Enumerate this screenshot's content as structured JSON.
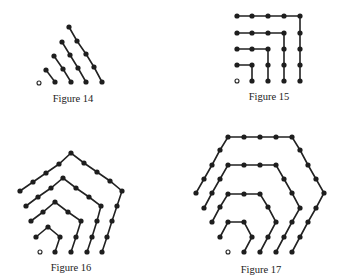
{
  "figures": [
    {
      "caption": "Figure 14",
      "caption_pos": [
        73,
        93
      ],
      "origin": [
        39,
        83
      ],
      "chains": [
        [
          [
            46,
            70
          ],
          [
            55,
            82
          ]
        ],
        [
          [
            54,
            56
          ],
          [
            63,
            69
          ],
          [
            71,
            82
          ]
        ],
        [
          [
            62,
            42
          ],
          [
            70,
            55
          ],
          [
            78,
            68
          ],
          [
            86,
            82
          ]
        ],
        [
          [
            69,
            27
          ],
          [
            77,
            41
          ],
          [
            86,
            54
          ],
          [
            94,
            67
          ],
          [
            102,
            82
          ]
        ]
      ]
    },
    {
      "caption": "Figure 15",
      "caption_pos": [
        269,
        91
      ],
      "origin": [
        237,
        81
      ],
      "chains": [
        [
          [
            237,
            65
          ],
          [
            252,
            65
          ],
          [
            252,
            81
          ]
        ],
        [
          [
            237,
            49
          ],
          [
            252,
            49
          ],
          [
            268,
            49
          ],
          [
            268,
            65
          ],
          [
            268,
            81
          ]
        ],
        [
          [
            237,
            33
          ],
          [
            252,
            33
          ],
          [
            268,
            33
          ],
          [
            284,
            33
          ],
          [
            284,
            49
          ],
          [
            284,
            65
          ],
          [
            284,
            81
          ]
        ],
        [
          [
            237,
            16
          ],
          [
            252,
            16
          ],
          [
            268,
            16
          ],
          [
            284,
            16
          ],
          [
            300,
            16
          ],
          [
            300,
            33
          ],
          [
            300,
            49
          ],
          [
            300,
            65
          ],
          [
            300,
            81
          ]
        ]
      ]
    },
    {
      "caption": "Figure 16",
      "caption_pos": [
        71,
        262
      ],
      "origin": [
        40,
        252
      ],
      "chains": [
        [
          [
            36,
            237
          ],
          [
            48,
            227
          ],
          [
            60,
            237
          ],
          [
            55,
            252
          ]
        ],
        [
          [
            31,
            221
          ],
          [
            43,
            212
          ],
          [
            55,
            202
          ],
          [
            68,
            212
          ],
          [
            81,
            221
          ],
          [
            76,
            237
          ],
          [
            71,
            252
          ]
        ],
        [
          [
            26,
            206
          ],
          [
            38,
            197
          ],
          [
            51,
            188
          ],
          [
            63,
            178
          ],
          [
            76,
            188
          ],
          [
            89,
            197
          ],
          [
            101,
            206
          ],
          [
            97,
            221
          ],
          [
            92,
            237
          ],
          [
            87,
            252
          ]
        ],
        [
          [
            20,
            191
          ],
          [
            33,
            182
          ],
          [
            46,
            173
          ],
          [
            59,
            164
          ],
          [
            71,
            153
          ],
          [
            84,
            163
          ],
          [
            97,
            172
          ],
          [
            110,
            181
          ],
          [
            122,
            191
          ],
          [
            117,
            206
          ],
          [
            112,
            221
          ],
          [
            107,
            237
          ],
          [
            102,
            252
          ]
        ]
      ]
    },
    {
      "caption": "Figure 17",
      "caption_pos": [
        261,
        264
      ],
      "origin": [
        228,
        252
      ],
      "chains": [
        [
          [
            220,
            237
          ],
          [
            228,
            222
          ],
          [
            244,
            222
          ],
          [
            252,
            237
          ],
          [
            244,
            252
          ]
        ],
        [
          [
            212,
            222
          ],
          [
            220,
            207
          ],
          [
            228,
            194
          ],
          [
            244,
            194
          ],
          [
            260,
            194
          ],
          [
            268,
            207
          ],
          [
            276,
            222
          ],
          [
            268,
            237
          ],
          [
            260,
            252
          ]
        ],
        [
          [
            204,
            208
          ],
          [
            212,
            193
          ],
          [
            220,
            179
          ],
          [
            228,
            165
          ],
          [
            244,
            165
          ],
          [
            260,
            165
          ],
          [
            276,
            165
          ],
          [
            284,
            179
          ],
          [
            292,
            193
          ],
          [
            300,
            208
          ],
          [
            292,
            222
          ],
          [
            284,
            237
          ],
          [
            276,
            252
          ]
        ],
        [
          [
            196,
            193
          ],
          [
            204,
            179
          ],
          [
            212,
            165
          ],
          [
            220,
            150
          ],
          [
            228,
            137
          ],
          [
            244,
            137
          ],
          [
            260,
            137
          ],
          [
            276,
            137
          ],
          [
            292,
            137
          ],
          [
            300,
            150
          ],
          [
            308,
            165
          ],
          [
            316,
            179
          ],
          [
            324,
            193
          ],
          [
            316,
            208
          ],
          [
            308,
            222
          ],
          [
            300,
            237
          ],
          [
            292,
            252
          ]
        ]
      ]
    }
  ],
  "style": {
    "line_color": "#222222",
    "dot_color": "#1e1e1e"
  }
}
